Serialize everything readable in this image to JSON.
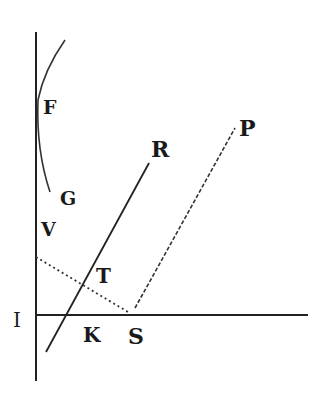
{
  "diagram": {
    "type": "geometric-construction",
    "stroke_color": "#222222",
    "background": "#ffffff",
    "labels": {
      "F": "F",
      "G": "G",
      "V": "V",
      "T": "T",
      "R": "R",
      "P": "P",
      "I": "I",
      "K": "K",
      "S": "S"
    },
    "elements": [
      {
        "name": "vertical-axis",
        "style": "solid",
        "from": [
          36,
          32
        ],
        "to": [
          36,
          381
        ]
      },
      {
        "name": "horizontal-line-IS",
        "style": "solid",
        "from": [
          36,
          315
        ],
        "to": [
          308,
          315
        ]
      },
      {
        "name": "curve-FG",
        "style": "solid",
        "points": [
          [
            65,
            40
          ],
          [
            38,
            100
          ],
          [
            50,
            192
          ]
        ]
      },
      {
        "name": "line-R",
        "style": "solid",
        "from": [
          46,
          352
        ],
        "to": [
          149,
          163
        ]
      },
      {
        "name": "line-SP",
        "style": "dashed",
        "from": [
          135,
          308
        ],
        "to": [
          235,
          128
        ]
      },
      {
        "name": "line-VS",
        "style": "dotted",
        "from": [
          36,
          257
        ],
        "to": [
          128,
          312
        ]
      }
    ]
  }
}
